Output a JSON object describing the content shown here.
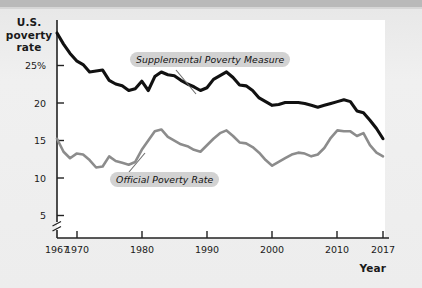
{
  "figure": {
    "y_axis_title": "U.S.\npoverty\nrate",
    "x_axis_title": "Year"
  },
  "axes": {
    "y_ticks": [
      "25%",
      "20",
      "15",
      "10",
      "5"
    ],
    "x_ticks": [
      "1967",
      "1970",
      "1980",
      "1990",
      "2000",
      "2010",
      "2017"
    ],
    "axis_break": "broken-y-axis-marker"
  },
  "labels": {
    "supplemental": "Supplemental Poverty Measure",
    "official": "Official Poverty Rate"
  },
  "colors": {
    "supplemental_line": "#111111",
    "official_line": "#8c8c8c",
    "plot_background": "#ffffff",
    "page_background": "#ededed",
    "label_background": "#d2d2d2",
    "axis": "#222222"
  },
  "chart_data": {
    "type": "line",
    "title": "",
    "subtitle": "",
    "xlabel": "Year",
    "ylabel": "U.S. poverty rate",
    "xlim": [
      1967,
      2017
    ],
    "ylim": [
      3.5,
      27
    ],
    "grid": false,
    "legend": "inline-annotations",
    "y_axis_break_below": 5,
    "y_tick_values": [
      5,
      10,
      15,
      20,
      25
    ],
    "x_tick_values": [
      1967,
      1970,
      1980,
      1990,
      2000,
      2010,
      2017
    ],
    "x": [
      1967,
      1968,
      1969,
      1970,
      1971,
      1972,
      1973,
      1974,
      1975,
      1976,
      1977,
      1978,
      1979,
      1980,
      1981,
      1982,
      1983,
      1984,
      1985,
      1986,
      1987,
      1988,
      1989,
      1990,
      1991,
      1992,
      1993,
      1994,
      1995,
      1996,
      1997,
      1998,
      1999,
      2000,
      2001,
      2002,
      2003,
      2004,
      2005,
      2006,
      2007,
      2008,
      2009,
      2010,
      2011,
      2012,
      2013,
      2014,
      2015,
      2016,
      2017
    ],
    "series": [
      {
        "name": "Supplemental Poverty Measure",
        "color": "#111111",
        "values": [
          25.6,
          24.4,
          23.4,
          22.6,
          22.2,
          21.4,
          21.5,
          21.6,
          20.5,
          20.1,
          19.9,
          19.4,
          19.6,
          20.4,
          19.4,
          20.9,
          21.4,
          21.1,
          21.0,
          20.5,
          20.1,
          19.8,
          19.4,
          19.7,
          20.6,
          21.0,
          21.4,
          20.8,
          20.0,
          19.9,
          19.4,
          18.6,
          18.2,
          17.8,
          17.9,
          18.1,
          18.1,
          18.1,
          18.0,
          17.8,
          17.6,
          17.8,
          18.0,
          18.2,
          18.4,
          18.2,
          17.2,
          17.0,
          16.2,
          15.3,
          14.2
        ]
      },
      {
        "name": "Official Poverty Rate",
        "color": "#8c8c8c",
        "values": [
          14.2,
          12.8,
          12.1,
          12.6,
          12.5,
          11.9,
          11.1,
          11.2,
          12.3,
          11.8,
          11.6,
          11.4,
          11.7,
          13.0,
          14.0,
          15.0,
          15.2,
          14.4,
          14.0,
          13.6,
          13.4,
          13.0,
          12.8,
          13.5,
          14.2,
          14.8,
          15.1,
          14.5,
          13.8,
          13.7,
          13.3,
          12.7,
          11.9,
          11.3,
          11.7,
          12.1,
          12.5,
          12.7,
          12.6,
          12.3,
          12.5,
          13.2,
          14.3,
          15.1,
          15.0,
          15.0,
          14.5,
          14.8,
          13.5,
          12.7,
          12.3
        ]
      }
    ]
  }
}
